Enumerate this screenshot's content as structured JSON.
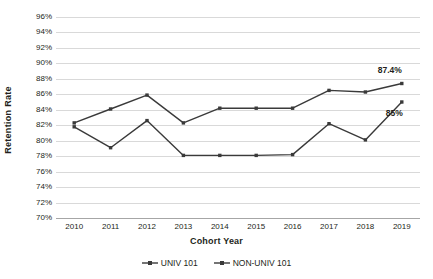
{
  "chart_data": {
    "type": "line",
    "title": "",
    "xlabel": "Cohort Year",
    "ylabel": "Retention Rate",
    "categories": [
      "2010",
      "2011",
      "2012",
      "2013",
      "2014",
      "2015",
      "2016",
      "2017",
      "2018",
      "2019"
    ],
    "ylim": [
      70,
      96
    ],
    "ytick_step": 2,
    "ytick_labels": [
      "96%",
      "94%",
      "92%",
      "90%",
      "88%",
      "86%",
      "84%",
      "82%",
      "80%",
      "78%",
      "76%",
      "74%",
      "72%",
      "70%"
    ],
    "ytick_values": [
      96,
      94,
      92,
      90,
      88,
      86,
      84,
      82,
      80,
      78,
      76,
      74,
      72,
      70
    ],
    "grid": true,
    "legend_position": "bottom",
    "series": [
      {
        "name": "UNIV 101",
        "color": "#3a3a3a",
        "values": [
          82.3,
          84.1,
          85.9,
          82.3,
          84.2,
          84.2,
          84.2,
          86.5,
          86.3,
          87.4
        ],
        "labels": [
          null,
          null,
          null,
          null,
          null,
          null,
          null,
          null,
          null,
          "87.4%"
        ]
      },
      {
        "name": "NON-UNIV 101",
        "color": "#3a3a3a",
        "values": [
          81.8,
          79.1,
          82.6,
          78.1,
          78.1,
          78.1,
          78.2,
          82.2,
          80.1,
          85.0
        ],
        "labels": [
          null,
          null,
          null,
          null,
          null,
          null,
          null,
          null,
          null,
          "85%"
        ]
      }
    ],
    "annotations": [
      {
        "text": "87.4%",
        "series": "UNIV 101",
        "x": "2019",
        "y": 87.4
      },
      {
        "text": "85%",
        "series": "NON-UNIV 101",
        "x": "2019",
        "y": 85.0
      }
    ]
  },
  "legend": {
    "items": [
      {
        "label": "UNIV 101"
      },
      {
        "label": "NON-UNIV 101"
      }
    ]
  }
}
